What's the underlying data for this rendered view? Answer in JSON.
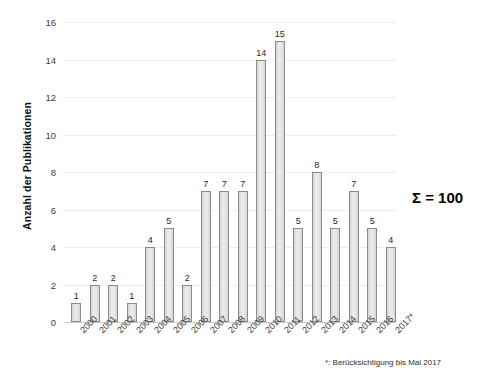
{
  "chart_data": {
    "type": "bar",
    "title": "",
    "subtitle": "",
    "xlabel": "",
    "ylabel": "Anzahl der Publikationen",
    "ylim": [
      0,
      16
    ],
    "ytick_step": 2,
    "ytick_labels": [
      "0",
      "2",
      "4",
      "6",
      "8",
      "10",
      "12",
      "14",
      "16"
    ],
    "grid": true,
    "legend": false,
    "legend_position": "none",
    "categories": [
      "2000",
      "2001",
      "2002",
      "2003",
      "2004",
      "2005",
      "2006",
      "2007",
      "2008",
      "2009",
      "2010",
      "2011",
      "2012",
      "2013",
      "2014",
      "2015",
      "2016",
      "2017*"
    ],
    "values": [
      1,
      2,
      2,
      1,
      4,
      5,
      2,
      7,
      7,
      7,
      14,
      15,
      5,
      8,
      5,
      7,
      5,
      4
    ],
    "value_labels": [
      "1",
      "2",
      "2",
      "1",
      "4",
      "5",
      "2",
      "7",
      "7",
      "7",
      "14",
      "15",
      "5",
      "8",
      "5",
      "7",
      "5",
      "4"
    ],
    "annotations": {
      "sum": "Σ = 100",
      "footnote": "*: Berücksichtigung bis Mai 2017"
    },
    "colors": {
      "bar_fill": "#e3e3e3",
      "bar_border": "#8c8c8c",
      "gridline": "#ededed",
      "axis": "#c9c9c9",
      "text": "#3d3d3d",
      "background": "#ffffff"
    }
  }
}
